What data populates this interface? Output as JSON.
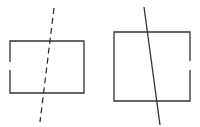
{
  "diagram": {
    "stroke_color": "#333333",
    "figures": [
      {
        "id": "left",
        "shape": "rectangle",
        "gap_side": "left",
        "line_style": "dashed"
      },
      {
        "id": "right",
        "shape": "rectangle",
        "gap_side": "right",
        "line_style": "solid"
      }
    ]
  }
}
